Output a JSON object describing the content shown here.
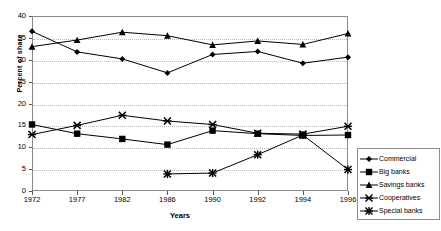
{
  "chart_data": {
    "type": "line",
    "title": "",
    "xlabel": "Years",
    "ylabel": "Percent of share",
    "categories": [
      "1972",
      "1977",
      "1982",
      "1986",
      "1990",
      "1992",
      "1994",
      "1996"
    ],
    "ylim": [
      0,
      40
    ],
    "ytick_step": 5,
    "yticks": [
      "0",
      "5",
      "10",
      "15",
      "20",
      "25",
      "30",
      "35",
      "40"
    ],
    "grid": "horizontal-dotted",
    "legend_position": "right",
    "series": [
      {
        "name": "Commercial",
        "marker": "diamond",
        "color": "#000000",
        "values": [
          36.5,
          31.8,
          30.2,
          27.0,
          31.2,
          31.9,
          29.2,
          30.6
        ]
      },
      {
        "name": "Big banks",
        "marker": "square",
        "color": "#000000",
        "values": [
          15.2,
          13.1,
          11.9,
          10.6,
          13.8,
          13.1,
          12.7,
          12.8
        ]
      },
      {
        "name": "Savings banks",
        "marker": "triangle",
        "color": "#000000",
        "values": [
          33.0,
          34.5,
          36.3,
          35.5,
          33.4,
          34.3,
          33.5,
          36.0
        ]
      },
      {
        "name": "Cooperatives",
        "marker": "cross",
        "color": "#000000",
        "values": [
          12.9,
          15.0,
          17.3,
          16.0,
          15.2,
          13.2,
          13.0,
          14.8
        ]
      },
      {
        "name": "Special banks",
        "marker": "asterisk",
        "color": "#000000",
        "values": [
          null,
          null,
          null,
          3.9,
          4.1,
          8.3,
          12.8,
          4.9
        ]
      }
    ]
  },
  "legend": {
    "items": [
      {
        "label": "Commercial"
      },
      {
        "label": "Big banks"
      },
      {
        "label": "Savings banks"
      },
      {
        "label": "Cooperatives"
      },
      {
        "label": "Special banks"
      }
    ]
  }
}
